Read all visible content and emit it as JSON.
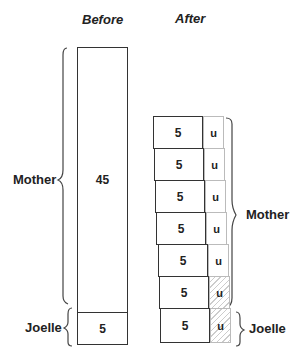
{
  "headings": {
    "before": "Before",
    "after": "After"
  },
  "before": {
    "mother_label": "Mother",
    "mother_value": "45",
    "joelle_label": "Joelle",
    "joelle_value": "5"
  },
  "after": {
    "mother_label": "Mother",
    "joelle_label": "Joelle",
    "rows": [
      {
        "value": "5",
        "unit": "u",
        "hatched": false
      },
      {
        "value": "5",
        "unit": "u",
        "hatched": false
      },
      {
        "value": "5",
        "unit": "u",
        "hatched": false
      },
      {
        "value": "5",
        "unit": "u",
        "hatched": false
      },
      {
        "value": "5",
        "unit": "u",
        "hatched": false
      },
      {
        "value": "5",
        "unit": "u",
        "hatched": true
      },
      {
        "value": "5",
        "unit": "u",
        "hatched": true
      }
    ]
  }
}
